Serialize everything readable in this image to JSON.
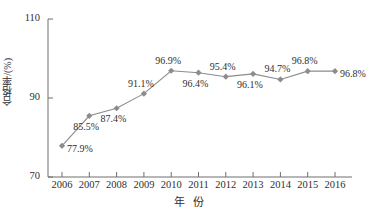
{
  "chart_data": {
    "type": "line",
    "title": "",
    "xlabel": "年 份",
    "ylabel": "合格率/(%)",
    "categories": [
      "2006",
      "2007",
      "2008",
      "2009",
      "2010",
      "2011",
      "2012",
      "2013",
      "2014",
      "2015",
      "2016"
    ],
    "values": [
      77.9,
      85.5,
      87.4,
      91.1,
      96.9,
      96.4,
      95.4,
      96.1,
      94.7,
      96.8,
      96.8
    ],
    "point_labels": [
      "77.9%",
      "85.5%",
      "87.4%",
      "91.1%",
      "96.9%",
      "96.4%",
      "95.4%",
      "96.1%",
      "94.7%",
      "96.8%",
      "96.8%"
    ],
    "label_positions": [
      "right",
      "below",
      "below",
      "above",
      "above",
      "below",
      "above",
      "below",
      "above",
      "above",
      "right"
    ],
    "ylim": [
      70,
      110
    ],
    "yticks": [
      "70",
      "90",
      "110"
    ],
    "ytick_values": [
      70,
      90,
      110
    ],
    "grid": false,
    "legend": "none",
    "series_color": "#8c8c8c",
    "marker": "diamond",
    "axis_color": "#6e6e6e"
  }
}
